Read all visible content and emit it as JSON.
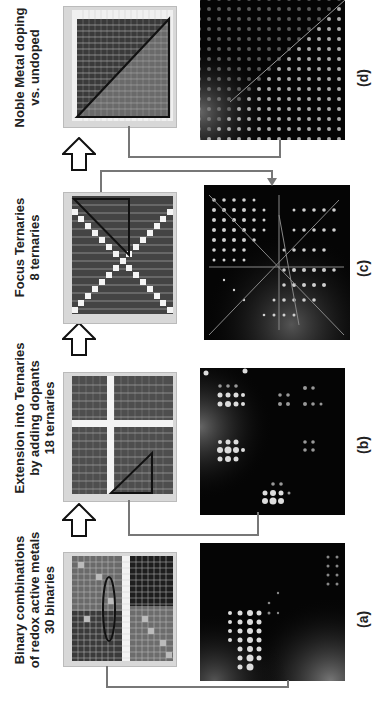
{
  "figure": {
    "stages": [
      {
        "id": "a",
        "title_lines": [
          "Binary combinations",
          "of redox active metals",
          "30 binaries"
        ],
        "panel_label": "(a)"
      },
      {
        "id": "b",
        "title_lines": [
          "Extension into Ternaries",
          "by adding dopants",
          "18 ternaries"
        ],
        "panel_label": "(b)"
      },
      {
        "id": "c",
        "title_lines": [
          "Focus Ternaries",
          "8 ternaries"
        ],
        "panel_label": "(c)"
      },
      {
        "id": "d",
        "title_lines": [
          "Noble Metal doping",
          "vs. undoped"
        ],
        "panel_label": "(d)"
      }
    ],
    "colors": {
      "connector": "#777777",
      "arrow_outline": "#111111",
      "photo_background": "#050505",
      "grid_frame": "#d8d8d8"
    }
  }
}
